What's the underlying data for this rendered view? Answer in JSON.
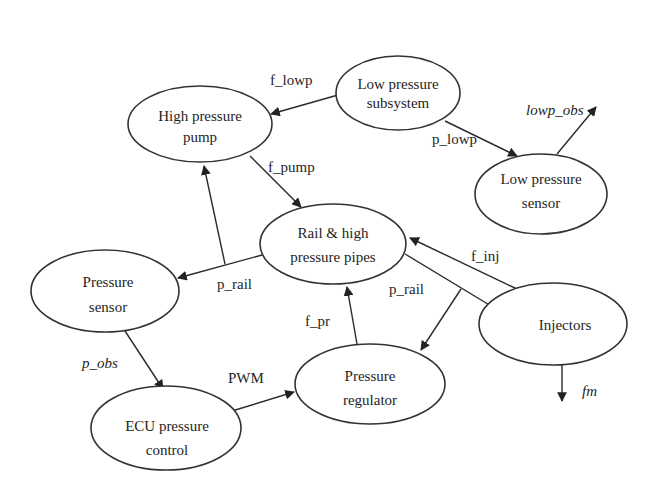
{
  "diagram": {
    "type": "block_diagram",
    "colors": {
      "stroke": "#333333",
      "text": "#1e1e1e",
      "background": "#ffffff"
    },
    "nodes": [
      {
        "id": "low_pressure_subsystem",
        "line1": "Low pressure",
        "line2": "subsystem",
        "cx": 398,
        "cy": 93,
        "rx": 62,
        "ry": 37
      },
      {
        "id": "high_pressure_pump",
        "line1": "High pressure",
        "line2": "pump",
        "cx": 200,
        "cy": 124,
        "rx": 72,
        "ry": 38
      },
      {
        "id": "low_pressure_sensor",
        "line1": "Low pressure",
        "line2": "sensor",
        "cx": 541,
        "cy": 194,
        "rx": 66,
        "ry": 40
      },
      {
        "id": "rail_high_pressure_pipes",
        "line1": "Rail & high",
        "line2": "pressure pipes",
        "cx": 333,
        "cy": 244,
        "rx": 73,
        "ry": 40
      },
      {
        "id": "pressure_sensor",
        "line1": "Pressure",
        "line2": "sensor",
        "cx": 105,
        "cy": 291,
        "rx": 74,
        "ry": 41
      },
      {
        "id": "injectors",
        "line1": "Injectors",
        "line2": "",
        "cx": 553,
        "cy": 324,
        "rx": 74,
        "ry": 41
      },
      {
        "id": "pressure_regulator",
        "line1": "Pressure",
        "line2": "regulator",
        "cx": 365,
        "cy": 382,
        "rx": 75,
        "ry": 40
      },
      {
        "id": "ecu_pressure_control",
        "line1": "ECU pressure",
        "line2": "control",
        "cx": 166,
        "cy": 427,
        "rx": 75,
        "ry": 42
      }
    ],
    "edges": [
      {
        "from": "low_pressure_subsystem",
        "to": "high_pressure_pump",
        "label": "f_lowp",
        "italic": false
      },
      {
        "from": "low_pressure_subsystem",
        "to": "low_pressure_sensor",
        "label": "p_lowp",
        "italic": false
      },
      {
        "from": "low_pressure_sensor",
        "to": "output",
        "label": "lowp_obs",
        "italic": true
      },
      {
        "from": "high_pressure_pump",
        "to": "rail_high_pressure_pipes",
        "label": "f_pump",
        "italic": false
      },
      {
        "from": "rail_high_pressure_pipes",
        "to": "pressure_sensor",
        "label": "p_rail",
        "italic": false
      },
      {
        "from": "rail_high_pressure_pipes",
        "to": "high_pressure_pump",
        "label": "p_rail (branch)",
        "italic": false
      },
      {
        "from": "injectors",
        "to": "rail_high_pressure_pipes",
        "label": "f_inj",
        "italic": false
      },
      {
        "from": "rail_high_pressure_pipes",
        "to": "injectors",
        "label": "p_rail",
        "italic": false
      },
      {
        "from": "rail_high_pressure_pipes",
        "to": "pressure_regulator",
        "label": "p_rail (branch)",
        "italic": false
      },
      {
        "from": "pressure_regulator",
        "to": "rail_high_pressure_pipes",
        "label": "f_pr",
        "italic": false
      },
      {
        "from": "pressure_sensor",
        "to": "ecu_pressure_control",
        "label": "p_obs",
        "italic": true
      },
      {
        "from": "ecu_pressure_control",
        "to": "pressure_regulator",
        "label": "PWM",
        "italic": false
      },
      {
        "from": "injectors",
        "to": "output",
        "label": "fm",
        "italic": true
      }
    ]
  },
  "labels": {
    "f_lowp": "f_lowp",
    "p_lowp": "p_lowp",
    "lowp_obs": "lowp_obs",
    "f_pump": "f_pump",
    "p_rail_left": "p_rail",
    "p_rail_right": "p_rail",
    "f_inj": "f_inj",
    "f_pr": "f_pr",
    "p_obs": "p_obs",
    "pwm": "PWM",
    "fm": "fm"
  },
  "nodes_text": {
    "lps": {
      "l1": "Low pressure",
      "l2": "subsystem"
    },
    "hpp": {
      "l1": "High pressure",
      "l2": "pump"
    },
    "lpsn": {
      "l1": "Low pressure",
      "l2": "sensor"
    },
    "rail": {
      "l1": "Rail & high",
      "l2": "pressure pipes"
    },
    "ps": {
      "l1": "Pressure",
      "l2": "sensor"
    },
    "inj": {
      "l1": "Injectors"
    },
    "pr": {
      "l1": "Pressure",
      "l2": "regulator"
    },
    "ecu": {
      "l1": "ECU pressure",
      "l2": "control"
    }
  }
}
